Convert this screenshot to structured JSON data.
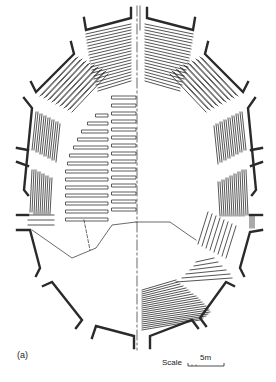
{
  "figure": {
    "label": "(a)",
    "type": "architectural floor plan"
  },
  "scale": {
    "label": "Scale",
    "value": "5m"
  },
  "colors": {
    "line": "#222222",
    "background": "#ffffff"
  }
}
